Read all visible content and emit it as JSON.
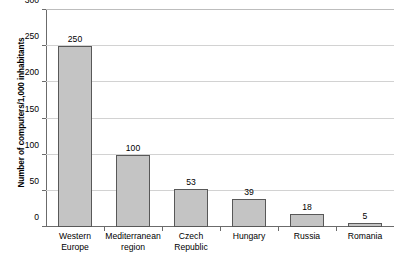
{
  "chart_data": {
    "type": "bar",
    "title": "",
    "xlabel": "",
    "ylabel": "Number of computers/1,000 inhabitants",
    "categories": [
      "Western Europe",
      "Mediterranean region",
      "Czech Republic",
      "Hungary",
      "Russia",
      "Romania"
    ],
    "category_lines": [
      [
        "Western",
        "Europe"
      ],
      [
        "Mediterranean",
        "region"
      ],
      [
        "Czech",
        "Republic"
      ],
      [
        "Hungary"
      ],
      [
        "Russia"
      ],
      [
        "Romania"
      ]
    ],
    "values": [
      250,
      100,
      53,
      39,
      18,
      5
    ],
    "value_labels": [
      "250",
      "100",
      "53",
      "39",
      "18",
      "5"
    ],
    "ylim": [
      0,
      300
    ],
    "yticks": [
      0,
      50,
      100,
      150,
      200,
      250,
      300
    ],
    "ytick_labels": [
      "0",
      "50",
      "100",
      "150",
      "200",
      "250",
      "300"
    ],
    "grid": true,
    "legend": false,
    "colors": {
      "bar_fill": "#c4c4c4",
      "bar_border": "#585858",
      "gridline": "#d2d2d2",
      "axis": "#6b6b6b",
      "background": "#ffffff",
      "text": "#000000"
    }
  }
}
